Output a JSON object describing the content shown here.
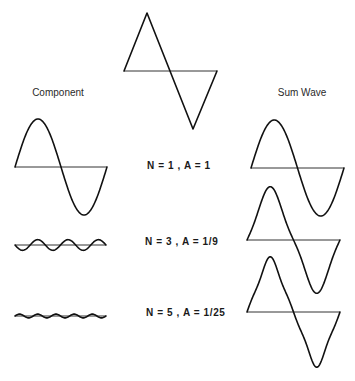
{
  "headings": {
    "component": "Component",
    "sum_wave": "Sum Wave"
  },
  "labels": [
    "N = 1 ,  A = 1",
    "N = 3 ,  A = 1/9",
    "N = 5 ,  A = 1/25"
  ],
  "target_wave": {
    "name": "triangle wave",
    "axis": {
      "x0": 124,
      "x1": 217,
      "y": 71
    },
    "points": [
      [
        124,
        71
      ],
      [
        147,
        13
      ],
      [
        193,
        129
      ],
      [
        217,
        71
      ]
    ]
  },
  "components": [
    {
      "n": 1,
      "a": 1,
      "sign": 1,
      "x0": 15,
      "x1": 107,
      "axis_y": 167,
      "scale_px": 48
    },
    {
      "n": 3,
      "a": 0.1111,
      "sign": -1,
      "x0": 15,
      "x1": 106,
      "axis_y": 245,
      "scale_px": 48
    },
    {
      "n": 5,
      "a": 0.04,
      "sign": 1,
      "x0": 15,
      "x1": 106,
      "axis_y": 316,
      "scale_px": 48
    }
  ],
  "sums": [
    {
      "up_to_n": 1,
      "x0": 251,
      "x1": 344,
      "axis_y": 168,
      "scale_px": 48
    },
    {
      "up_to_n": 3,
      "x0": 247,
      "x1": 340,
      "axis_y": 240,
      "scale_px": 48
    },
    {
      "up_to_n": 5,
      "x0": 247,
      "x1": 340,
      "axis_y": 312,
      "scale_px": 48
    }
  ],
  "colors": {
    "stroke": "#111111",
    "axis": "#333333",
    "background": "#ffffff"
  }
}
